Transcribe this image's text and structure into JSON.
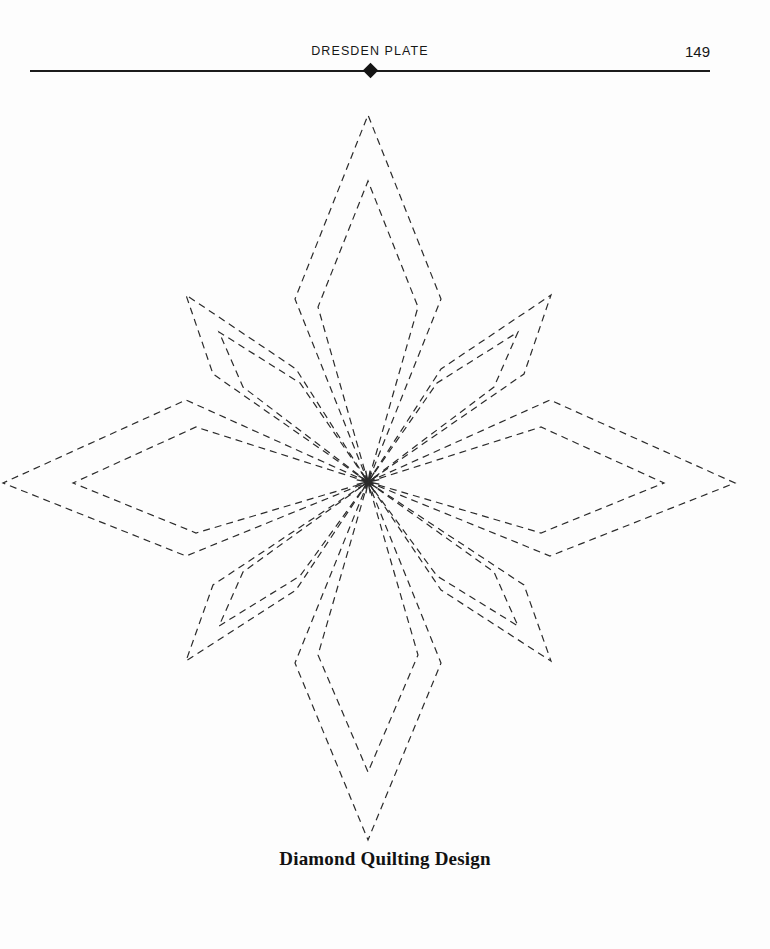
{
  "page": {
    "background_color": "#fdfdfd",
    "width": 770,
    "height": 949
  },
  "running_head": {
    "title": "DRESDEN PLATE",
    "folio": "149",
    "ornament": "diamond-ornament",
    "rule_color": "#1c1c1c"
  },
  "caption": {
    "text": "Diamond Quilting Design"
  },
  "artwork": {
    "name": "eight-point-star-diamond-quilting-pattern",
    "stroke_color": "#2b2b2b",
    "stroke_width": 1.2,
    "dash_pattern": "7 5",
    "center": {
      "x": 368,
      "y": 482
    },
    "description": "Eight-pointed star built from nested dashed diamonds radiating from a common center: four long arms (up, down, left, right) and four shorter diagonal arms.",
    "arms": [
      {
        "name": "arm-up",
        "direction": "up",
        "outer": {
          "tip_x": 368,
          "tip_y": 115,
          "left_x": 295,
          "left_y": 299,
          "right_x": 441,
          "right_y": 299
        },
        "inner": {
          "tip_x": 368,
          "tip_y": 181,
          "left_x": 318,
          "left_y": 307,
          "right_x": 418,
          "right_y": 307
        }
      },
      {
        "name": "arm-down",
        "direction": "down",
        "outer": {
          "tip_x": 368,
          "tip_y": 840,
          "left_x": 295,
          "left_y": 663,
          "right_x": 441,
          "right_y": 663
        },
        "inner": {
          "tip_x": 368,
          "tip_y": 772,
          "left_x": 318,
          "left_y": 655,
          "right_x": 418,
          "right_y": 655
        }
      },
      {
        "name": "arm-left",
        "direction": "left",
        "outer": {
          "tip_x": 3,
          "tip_y": 483,
          "left_x": 186,
          "left_y": 400,
          "right_x": 186,
          "right_y": 556
        },
        "inner": {
          "tip_x": 73,
          "tip_y": 483,
          "left_x": 196,
          "left_y": 427,
          "right_x": 196,
          "right_y": 533
        }
      },
      {
        "name": "arm-right",
        "direction": "right",
        "outer": {
          "tip_x": 735,
          "tip_y": 483,
          "left_x": 550,
          "left_y": 400,
          "right_x": 550,
          "right_y": 556
        },
        "inner": {
          "tip_x": 664,
          "tip_y": 483,
          "left_x": 541,
          "left_y": 427,
          "right_x": 541,
          "right_y": 533
        }
      },
      {
        "name": "arm-upper-left",
        "direction": "upper-left",
        "outer": {
          "tip_x": 186,
          "tip_y": 295,
          "left_x": 213,
          "left_y": 374,
          "right_x": 296,
          "right_y": 369
        },
        "inner": {
          "tip_x": 219,
          "tip_y": 332,
          "left_x": 243,
          "left_y": 387,
          "right_x": 300,
          "right_y": 383
        }
      },
      {
        "name": "arm-upper-right",
        "direction": "upper-right",
        "outer": {
          "tip_x": 551,
          "tip_y": 295,
          "left_x": 441,
          "left_y": 369,
          "right_x": 524,
          "right_y": 374
        },
        "inner": {
          "tip_x": 518,
          "tip_y": 332,
          "left_x": 437,
          "left_y": 383,
          "right_x": 494,
          "right_y": 387
        }
      },
      {
        "name": "arm-lower-left",
        "direction": "lower-left",
        "outer": {
          "tip_x": 186,
          "tip_y": 661,
          "left_x": 296,
          "left_y": 590,
          "right_x": 213,
          "right_y": 585
        },
        "inner": {
          "tip_x": 219,
          "tip_y": 626,
          "left_x": 300,
          "left_y": 576,
          "right_x": 243,
          "right_y": 572
        }
      },
      {
        "name": "arm-lower-right",
        "direction": "lower-right",
        "outer": {
          "tip_x": 551,
          "tip_y": 661,
          "left_x": 524,
          "left_y": 585,
          "right_x": 441,
          "right_y": 590
        },
        "inner": {
          "tip_x": 518,
          "tip_y": 626,
          "left_x": 494,
          "left_y": 572,
          "right_x": 437,
          "right_y": 576
        }
      }
    ]
  }
}
